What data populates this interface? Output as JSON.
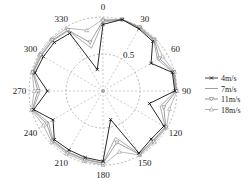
{
  "chart_data": {
    "type": "polar-line",
    "title": "",
    "angle_ticks": [
      "0",
      "30",
      "60",
      "90",
      "120",
      "150",
      "180",
      "210",
      "240",
      "270",
      "300",
      "330"
    ],
    "radial_ticks": [
      "0.5"
    ],
    "rlim": [
      0,
      1
    ],
    "grid": true,
    "legend_position": "right",
    "angles": [
      0,
      15,
      30,
      45,
      60,
      75,
      90,
      105,
      120,
      135,
      150,
      165,
      180,
      195,
      210,
      225,
      240,
      255,
      270,
      285,
      300,
      315,
      330,
      345
    ],
    "series": [
      {
        "name": "4m/s",
        "marker": "x",
        "color": "#111111",
        "values": [
          0.9,
          1.0,
          0.97,
          0.95,
          0.75,
          0.97,
          0.97,
          0.65,
          0.95,
          0.92,
          0.97,
          0.4,
          0.95,
          0.93,
          0.92,
          0.93,
          0.78,
          0.97,
          0.75,
          0.95,
          0.93,
          0.93,
          0.9,
          0.3
        ]
      },
      {
        "name": "7m/s",
        "marker": "none",
        "color": "#888888",
        "values": [
          0.93,
          1.0,
          0.98,
          0.97,
          0.85,
          0.98,
          0.98,
          0.8,
          0.97,
          0.95,
          0.98,
          0.65,
          0.97,
          0.95,
          0.95,
          0.95,
          0.85,
          0.98,
          0.85,
          0.97,
          0.96,
          0.96,
          0.94,
          0.6
        ]
      },
      {
        "name": "11m/s",
        "marker": "triangle-down",
        "color": "#777777",
        "values": [
          0.95,
          1.0,
          0.99,
          0.98,
          0.88,
          0.99,
          0.99,
          0.85,
          0.98,
          0.96,
          0.99,
          0.72,
          0.98,
          0.96,
          0.96,
          0.96,
          0.88,
          0.99,
          0.88,
          0.98,
          0.97,
          0.97,
          0.95,
          0.68
        ]
      },
      {
        "name": "18m/s",
        "marker": "triangle-up",
        "color": "#999999",
        "values": [
          0.97,
          1.0,
          1.0,
          0.99,
          0.93,
          1.0,
          1.0,
          0.93,
          0.99,
          0.98,
          1.0,
          0.85,
          1.0,
          0.98,
          0.98,
          0.98,
          0.93,
          1.0,
          0.93,
          0.99,
          0.99,
          0.99,
          0.98,
          0.85
        ]
      }
    ]
  }
}
